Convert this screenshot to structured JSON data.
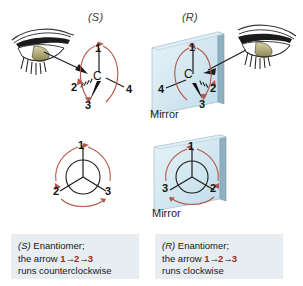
{
  "figure": {
    "background_color": "#ffffff",
    "width": 303,
    "height": 286,
    "topic": "R and S enantiomers viewed as mirror images"
  },
  "colors": {
    "mirror_glass_light": "#eaf4f8",
    "mirror_glass_mid": "#cfe4ee",
    "mirror_edge": "#9cb7c4",
    "mirror_side": "#7e98a7",
    "rotation_arrow": "#b5564a",
    "number_text": "#141414",
    "caption_background": "#e7edf1",
    "caption_number": "#9c2a22"
  },
  "top_row": {
    "left": {
      "descriptor": "(S)",
      "eye_icon": "eye-icon",
      "center_atom": "C",
      "substituents": [
        {
          "rank": "1",
          "position": "top",
          "bond": "plain"
        },
        {
          "rank": "2",
          "position": "left",
          "bond": "hashed-wedge"
        },
        {
          "rank": "3",
          "position": "bottom",
          "bond": "solid-wedge"
        },
        {
          "rank": "4",
          "position": "right",
          "bond": "plain"
        }
      ],
      "rotation_sense": "counterclockwise"
    },
    "right": {
      "descriptor": "(R)",
      "eye_icon": "eye-icon",
      "center_atom": "C",
      "mirror_label": "Mirror",
      "substituents": [
        {
          "rank": "1",
          "position": "top",
          "bond": "plain"
        },
        {
          "rank": "4",
          "position": "left",
          "bond": "plain"
        },
        {
          "rank": "3",
          "position": "bottom",
          "bond": "solid-wedge"
        },
        {
          "rank": "2",
          "position": "right",
          "bond": "hashed-wedge"
        }
      ],
      "rotation_sense": "clockwise"
    }
  },
  "bottom_row": {
    "left": {
      "view": "newman-projection",
      "spokes": [
        {
          "rank": "1",
          "position": "top"
        },
        {
          "rank": "2",
          "position": "bottom-left"
        },
        {
          "rank": "3",
          "position": "bottom-right"
        }
      ],
      "rotation_sense": "counterclockwise"
    },
    "right": {
      "view": "newman-projection-mirrored",
      "mirror_label": "Mirror",
      "spokes": [
        {
          "rank": "1",
          "position": "top"
        },
        {
          "rank": "3",
          "position": "bottom-left"
        },
        {
          "rank": "2",
          "position": "bottom-right"
        }
      ],
      "rotation_sense": "clockwise"
    }
  },
  "captions": {
    "left": {
      "descriptor": "(S)",
      "title_rest": " Enantiomer;",
      "line2_prefix": "the arrow ",
      "n1": "1",
      "arrow1": "→",
      "n2": "2",
      "arrow2": "→",
      "n3": "3",
      "line3": "runs counterclockwise"
    },
    "right": {
      "descriptor": "(R)",
      "title_rest": " Enantiomer;",
      "line2_prefix": "the arrow ",
      "n1": "1",
      "arrow1": "→",
      "n2": "2",
      "arrow2": "→",
      "n3": "3",
      "line3": "runs clockwise"
    }
  }
}
